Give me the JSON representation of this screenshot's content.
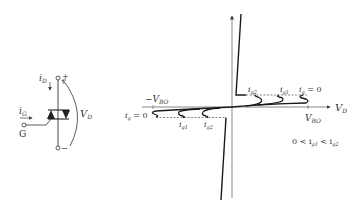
{
  "circuit": {
    "gate_current_label": "i",
    "gate_current_sub": "G",
    "gate_terminal_label": "G",
    "device_current_label": "i",
    "device_current_sub": "D",
    "voltage_label": "V",
    "voltage_sub": "D",
    "plus_sign": "+",
    "minus_sign": "−"
  },
  "chart": {
    "x_axis_label": "V",
    "x_axis_sub": "D",
    "pos_breakover_label": "V",
    "pos_breakover_sub": "BO",
    "neg_breakover_label": "−V",
    "neg_breakover_sub": "BO",
    "forward_curves": [
      {
        "label": "i",
        "sub": "g2"
      },
      {
        "label": "i",
        "sub": "g1"
      },
      {
        "label": "i",
        "sub": "g",
        "suffix": " = 0"
      }
    ],
    "reverse_curves": [
      {
        "label": "i",
        "sub": "g",
        "suffix": " = 0"
      },
      {
        "label": "i",
        "sub": "g1"
      },
      {
        "label": "i",
        "sub": "g2"
      }
    ],
    "condition_text": "0 < i",
    "condition_sub1": "g1",
    "condition_mid": " < i",
    "condition_sub2": "g2"
  },
  "colors": {
    "line": "#1a1a1a",
    "axis": "#555555",
    "text": "#333333"
  }
}
